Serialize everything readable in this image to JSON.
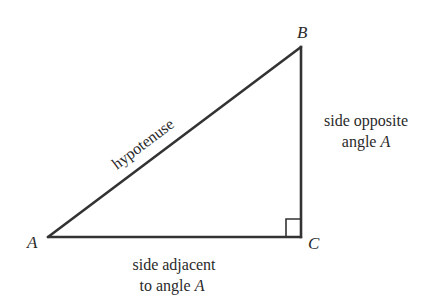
{
  "diagram": {
    "type": "right-triangle",
    "vertices": {
      "A": {
        "label": "A",
        "x": 48,
        "y": 237
      },
      "B": {
        "label": "B",
        "x": 301,
        "y": 47
      },
      "C": {
        "label": "C",
        "x": 301,
        "y": 237
      }
    },
    "right_angle_at": "C",
    "stroke_color": "#333333",
    "labels": {
      "hypotenuse": "hypotenuse",
      "opposite_line1": "side opposite",
      "opposite_line2_prefix": "angle ",
      "opposite_line2_var": "A",
      "adjacent_line1": "side adjacent",
      "adjacent_line2_prefix": "to angle ",
      "adjacent_line2_var": "A"
    }
  }
}
